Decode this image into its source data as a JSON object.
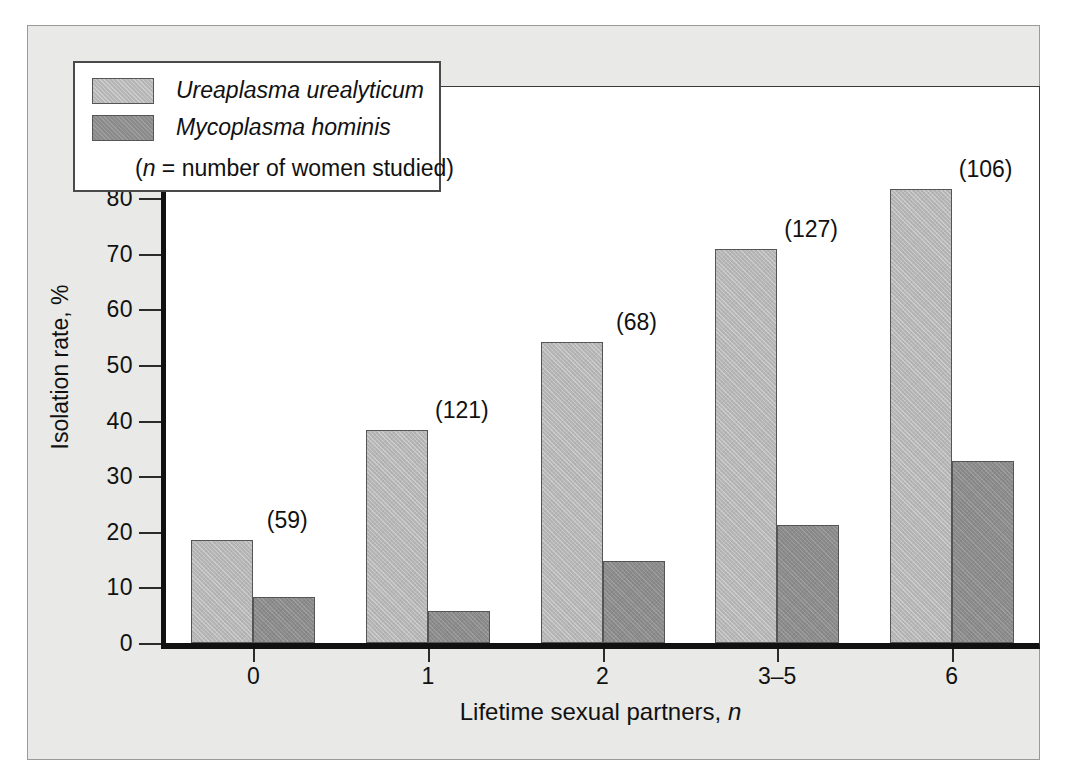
{
  "chart_data": {
    "type": "bar",
    "title": "",
    "xlabel": "Lifetime sexual partners, n",
    "ylabel": "Isolation rate, %",
    "categories": [
      "0",
      "1",
      "2",
      "3–5",
      "6"
    ],
    "series": [
      {
        "name": "Ureaplasma urealyticum",
        "color": "#b6b6b6",
        "values": [
          18.5,
          38.3,
          54.2,
          70.8,
          81.6
        ]
      },
      {
        "name": "Mycoplasma hominis",
        "color": "#8b8b8b",
        "values": [
          8.2,
          5.7,
          14.8,
          21.3,
          32.8
        ]
      }
    ],
    "annotations": [
      "(59)",
      "(121)",
      "(68)",
      "(127)",
      "(106)"
    ],
    "ylim": [
      0,
      100
    ],
    "yticks": [
      0,
      10,
      20,
      30,
      40,
      50,
      60,
      70,
      80,
      90,
      100
    ],
    "ytick_labels": [
      "0",
      "10",
      "20",
      "30",
      "40",
      "50",
      "60",
      "70",
      "80",
      "90",
      "100"
    ],
    "grid": false,
    "legend_position": "top-left"
  },
  "legend": {
    "entries": [
      {
        "label": "Ureaplasma urealyticum",
        "color": "#b6b6b6"
      },
      {
        "label": "Mycoplasma hominis",
        "color": "#8b8b8b"
      }
    ],
    "note_italic": "n",
    "note_rest": " = number of women studied)",
    "note_open": "("
  },
  "axis": {
    "x_title_text": "Lifetime sexual partners, ",
    "x_title_italic": "n",
    "y_title": "Isolation rate, %"
  },
  "colors": {
    "series_light": "#b6b6b6",
    "series_dark": "#8b8b8b",
    "panel_background": "#e9e9e7",
    "plot_background": "#ffffff",
    "axis_line": "#111111",
    "text": "#111111"
  }
}
